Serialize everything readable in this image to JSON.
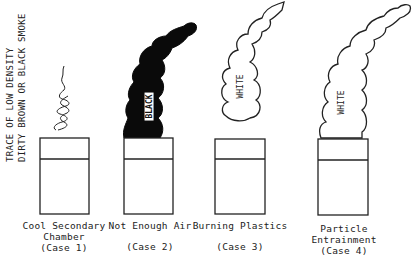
{
  "side_note": {
    "line1": "TRACE OF LOW DENSITY",
    "line2": "DIRTY BROWN OR BLACK SMOKE"
  },
  "cases": [
    {
      "title_lines": [
        "Cool Secondary",
        "Chamber"
      ],
      "case_label": "(Case 1)",
      "smoke": "trace wisp",
      "smoke_label": ""
    },
    {
      "title_lines": [
        "Not Enough Air"
      ],
      "case_label": "(Case 2)",
      "smoke": "dense black plume",
      "smoke_label": "BLACK"
    },
    {
      "title_lines": [
        "Burning Plastics"
      ],
      "case_label": "(Case 3)",
      "smoke": "detached white plume",
      "smoke_label": "WHITE"
    },
    {
      "title_lines": [
        "Particle",
        "Entrainment"
      ],
      "case_label": "(Case 4)",
      "smoke": "attached white plume",
      "smoke_label": "WHITE"
    }
  ]
}
